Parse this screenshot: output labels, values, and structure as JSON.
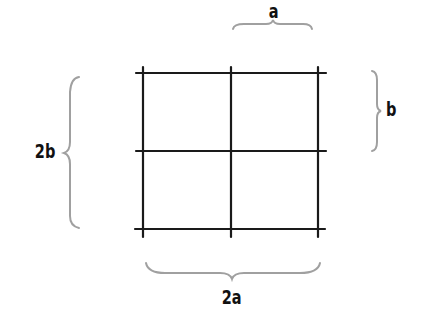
{
  "diagram": {
    "type": "grid",
    "rows": 2,
    "cols": 2,
    "labels": {
      "top": "a",
      "right": "b",
      "left": "2b",
      "bottom": "2a"
    },
    "colors": {
      "grid_lines": "#1a1a1a",
      "braces": "#a0a0a0",
      "text": "#111111",
      "background": "#ffffff"
    }
  }
}
